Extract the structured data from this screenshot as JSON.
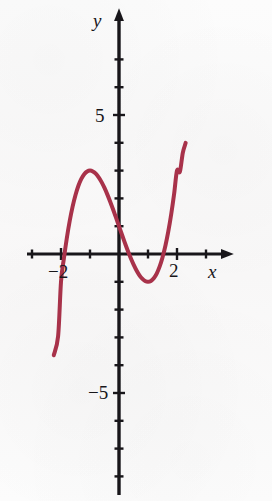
{
  "figure": {
    "background_color": "#fbfafa",
    "width": 272,
    "height": 501
  },
  "axes": {
    "x_axis_label": "x",
    "y_axis_label": "y",
    "x_tick_labels": [
      "−2",
      "2"
    ],
    "y_tick_labels": [
      "5",
      "−5"
    ],
    "axis_color": "#18161a",
    "arrowheads": [
      "x-positive",
      "y-positive"
    ],
    "origin_px": {
      "x": 119,
      "y": 254
    },
    "px_per_unit_x": 29.0,
    "px_per_unit_y": 27.8
  },
  "chart_data": {
    "type": "line",
    "title": "",
    "subtitle": "",
    "xlabel": "x",
    "ylabel": "y",
    "xlim": [
      -3.1,
      2.6
    ],
    "ylim": [
      -8.2,
      8.1
    ],
    "xticks": [
      -3,
      -2,
      -1,
      1,
      2
    ],
    "yticks": [
      -8,
      -7,
      -6,
      -5,
      -4,
      -3,
      -2,
      -1,
      1,
      2,
      3,
      4,
      5,
      6,
      7,
      8
    ],
    "xtick_labels": {
      "-2": "−2",
      "2": "2"
    },
    "ytick_labels": {
      "5": "5",
      "-5": "−5"
    },
    "grid": false,
    "legend": null,
    "legend_position": "none",
    "series": [
      {
        "name": "cubic",
        "color": "#a8324a",
        "linewidth": 4.0,
        "equation": "y = x^3 - 3x + 1",
        "x": [
          -2.25,
          -2.1,
          -2.0,
          -1.9,
          -1.8,
          -1.7,
          -1.6,
          -1.5,
          -1.4,
          -1.3,
          -1.2,
          -1.1,
          -1.0,
          -0.9,
          -0.8,
          -0.7,
          -0.6,
          -0.5,
          -0.4,
          -0.3,
          -0.2,
          -0.1,
          0.0,
          0.1,
          0.2,
          0.3,
          0.35,
          0.4,
          0.5,
          0.6,
          0.7,
          0.8,
          0.9,
          1.0,
          1.1,
          1.2,
          1.3,
          1.4,
          1.5,
          1.6,
          1.7,
          1.8,
          1.9,
          2.0,
          2.1,
          2.2,
          2.3
        ],
        "y": [
          -3.64,
          -2.96,
          -1.0,
          -0.159,
          0.568,
          1.187,
          1.704,
          2.125,
          2.456,
          2.703,
          2.872,
          2.969,
          3.0,
          2.971,
          2.888,
          2.757,
          2.584,
          2.375,
          2.136,
          1.873,
          1.592,
          1.299,
          1.0,
          0.701,
          0.408,
          0.127,
          -0.007,
          -0.136,
          -0.375,
          -0.584,
          -0.757,
          -0.888,
          -0.971,
          -1.0,
          -0.969,
          -0.872,
          -0.703,
          -0.456,
          -0.125,
          0.296,
          0.813,
          1.432,
          2.159,
          3.0,
          2.96,
          3.64,
          4.0
        ],
        "features": {
          "local_maximum": {
            "x": -1.0,
            "y": 3.0
          },
          "local_minimum": {
            "x": 1.0,
            "y": -1.0
          },
          "roots_approx": [
            -1.879,
            0.347,
            1.532
          ],
          "y_intercept": 1.0
        },
        "visible_x_range": [
          -2.21,
          2.31
        ]
      }
    ]
  }
}
